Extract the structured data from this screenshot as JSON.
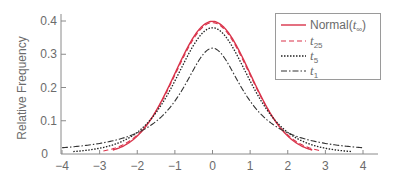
{
  "chart_data": {
    "type": "line",
    "title": "",
    "xlabel": "",
    "ylabel": "Relative Frequency",
    "xlim": [
      -4,
      4
    ],
    "ylim": [
      0,
      0.42
    ],
    "x_ticks": [
      -4,
      -3,
      -2,
      -1,
      0,
      1,
      2,
      3,
      4
    ],
    "x_tick_labels": [
      "−4",
      "−3",
      "−2",
      "−1",
      "0",
      "1",
      "2",
      "3",
      "4"
    ],
    "y_ticks": [
      0,
      0.1,
      0.2,
      0.3,
      0.4
    ],
    "y_tick_labels": [
      "0",
      "0.1",
      "0.2",
      "0.3",
      "0.4"
    ],
    "grid": false,
    "legend_position": "upper right",
    "series": [
      {
        "name": "Normal(t∞)",
        "label_main": "Normal(",
        "label_italic": "t",
        "label_sub": "∞",
        "label_tail": ")",
        "df": null,
        "color": "#d9334a",
        "dash": "",
        "width": 1.4,
        "x_range": [
          -2.65,
          2.65
        ],
        "peak": 0.399
      },
      {
        "name": "t25",
        "label_main": "",
        "label_italic": "t",
        "label_sub": "25",
        "label_tail": "",
        "df": 25,
        "color": "#d9334a",
        "dash": "5,3",
        "width": 1.1,
        "x_range": [
          -2.9,
          2.9
        ],
        "peak": 0.396
      },
      {
        "name": "t5",
        "label_main": "",
        "label_italic": "t",
        "label_sub": "5",
        "label_tail": "",
        "df": 5,
        "color": "#222222",
        "dash": "1.5,1.5",
        "width": 1.3,
        "x_range": [
          -3.7,
          3.7
        ],
        "peak": 0.38
      },
      {
        "name": "t1",
        "label_main": "",
        "label_italic": "t",
        "label_sub": "1",
        "label_tail": "",
        "df": 1,
        "color": "#333333",
        "dash": "6,2,1.5,2",
        "width": 1.1,
        "x_range": [
          -4,
          4
        ],
        "peak": 0.318
      }
    ]
  }
}
